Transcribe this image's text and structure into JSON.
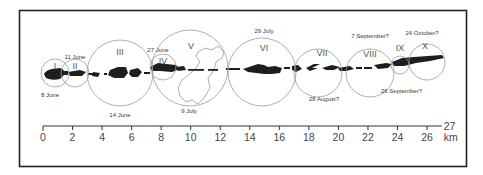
{
  "diagram": {
    "colors": {
      "frame": "#222222",
      "circle": "#9a9a9a",
      "blob": "#1e1e1e",
      "coastline": "#8a8a8a",
      "axis": "#333333",
      "text": "#3a3a3a"
    },
    "circles": [
      {
        "numeral": "I",
        "date": "8 June",
        "cx": 55,
        "cy": 73,
        "r": 14,
        "nx": 55,
        "ny": 69,
        "dx": 50,
        "dy": 97,
        "dateAnchor": "middle"
      },
      {
        "numeral": "II",
        "date": "11 June",
        "cx": 75,
        "cy": 73,
        "r": 14,
        "nx": 75,
        "ny": 69,
        "dx": 75,
        "dy": 59,
        "dateAnchor": "middle"
      },
      {
        "numeral": "III",
        "date": "14 June",
        "cx": 120,
        "cy": 73,
        "r": 33,
        "nx": 120,
        "ny": 55,
        "dx": 120,
        "dy": 117,
        "dateAnchor": "middle"
      },
      {
        "numeral": "IV",
        "date": "27 June",
        "cx": 163,
        "cy": 67,
        "r": 13,
        "nx": 163,
        "ny": 64,
        "dx": 158,
        "dy": 52,
        "dateAnchor": "middle"
      },
      {
        "numeral": "V",
        "date": "9 July",
        "cx": 190,
        "cy": 68,
        "r": 38,
        "nx": 191,
        "ny": 49,
        "dx": 189,
        "dy": 113,
        "dateAnchor": "middle"
      },
      {
        "numeral": "VI",
        "date": "29 July",
        "cx": 262,
        "cy": 72,
        "r": 34,
        "nx": 264,
        "ny": 51,
        "dx": 264,
        "dy": 33,
        "dateAnchor": "middle"
      },
      {
        "numeral": "VII",
        "date": "28 August?",
        "cx": 318,
        "cy": 73,
        "r": 24,
        "nx": 322,
        "ny": 56,
        "dx": 324,
        "dy": 101,
        "dateAnchor": "middle"
      },
      {
        "numeral": "VIII",
        "date": "7 September?",
        "cx": 370,
        "cy": 73,
        "r": 24,
        "nx": 370,
        "ny": 57,
        "dx": 370,
        "dy": 38,
        "dateAnchor": "middle"
      },
      {
        "numeral": "IX",
        "date": "26 September?",
        "cx": 400,
        "cy": 65,
        "r": 9,
        "nx": 400,
        "ny": 51,
        "dx": 381,
        "dy": 93,
        "dateAnchor": "start"
      },
      {
        "numeral": "X",
        "date": "24 October?",
        "cx": 427,
        "cy": 62,
        "r": 18,
        "nx": 425,
        "ny": 49,
        "dx": 422,
        "dy": 35,
        "dateAnchor": "middle"
      }
    ],
    "scale": {
      "unit": "km",
      "max_label": "27",
      "ticks": [
        "0",
        "2",
        "4",
        "6",
        "8",
        "10",
        "12",
        "14",
        "16",
        "18",
        "20",
        "22",
        "24",
        "26"
      ],
      "origin_px": 43,
      "px_per_km": 14.77,
      "baseline_y": 126
    }
  }
}
